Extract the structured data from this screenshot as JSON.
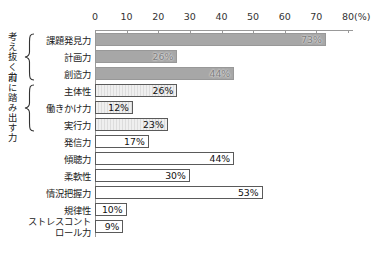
{
  "chart_data": {
    "type": "bar",
    "orientation": "horizontal",
    "title": "",
    "xlabel_unit": "(%)",
    "xlim": [
      0,
      80
    ],
    "x_ticks": [
      0,
      10,
      20,
      30,
      40,
      50,
      60,
      70,
      80
    ],
    "x_tick_labels": [
      "0",
      "10",
      "20",
      "30",
      "40",
      "50",
      "60",
      "70",
      "80"
    ],
    "grid": false,
    "legend": "none",
    "groups": [
      {
        "label": "考え抜く力",
        "row_indexes": [
          0,
          1,
          2
        ]
      },
      {
        "label": "前に踏み出す力",
        "row_indexes": [
          3,
          4,
          5
        ]
      }
    ],
    "categories": [
      "課題発見力",
      "計画力",
      "創造力",
      "主体性",
      "働きかけ力",
      "実行力",
      "発信力",
      "傾聴力",
      "柔軟性",
      "情況把握力",
      "規律性",
      "ストレスコントロール力"
    ],
    "values": [
      73,
      26,
      44,
      26,
      12,
      23,
      17,
      44,
      30,
      53,
      10,
      9
    ],
    "value_labels": [
      "73%",
      "26%",
      "44%",
      "26%",
      "12%",
      "23%",
      "17%",
      "44%",
      "30%",
      "53%",
      "10%",
      "9%"
    ],
    "bar_styles": [
      "dark",
      "dark",
      "dark",
      "striped",
      "striped",
      "striped",
      "plain",
      "plain",
      "plain",
      "plain",
      "plain",
      "plain"
    ],
    "colors": {
      "dark_bar_fill": "#a7a7a7",
      "striped_bar_fill": "#e8e8e8",
      "plain_bar_fill": "#ffffff",
      "bar_border": "#5a5a5a",
      "axis": "#999999",
      "text": "#222222"
    }
  }
}
